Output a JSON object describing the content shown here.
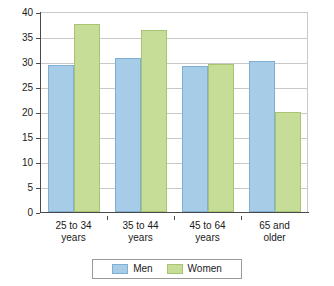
{
  "chart_data": {
    "type": "bar",
    "title": "",
    "xlabel": "",
    "ylabel": "",
    "ylim": [
      0,
      40
    ],
    "ytick_step": 5,
    "yticks": [
      "0",
      "5",
      "10",
      "15",
      "20",
      "25",
      "30",
      "35",
      "40"
    ],
    "grid": true,
    "legend_position": "bottom-center",
    "categories": [
      "25 to 34 years",
      "35 to 44 years",
      "45 to 64 years",
      "65 and older"
    ],
    "category_lines": [
      [
        "25 to 34",
        "years"
      ],
      [
        "35 to 44",
        "years"
      ],
      [
        "45 to 64",
        "years"
      ],
      [
        "65 and",
        "older"
      ]
    ],
    "series": [
      {
        "name": "Men",
        "color": "#a6cce8",
        "border": "#7fb0d4",
        "values": [
          29.5,
          30.8,
          29.2,
          30.3
        ]
      },
      {
        "name": "Women",
        "color": "#c5dd96",
        "border": "#a8c472",
        "values": [
          37.6,
          36.4,
          29.6,
          20.0
        ]
      }
    ]
  },
  "legend": {
    "items": [
      {
        "label": "Men",
        "swatch": "men-swatch-icon"
      },
      {
        "label": "Women",
        "swatch": "women-swatch-icon"
      }
    ]
  },
  "colors": {
    "men": "#a6cce8",
    "women": "#c5dd96",
    "axis": "#4a4a4a",
    "grid": "#c8c8c8",
    "background": "#ffffff",
    "text": "#1a1a1a"
  }
}
